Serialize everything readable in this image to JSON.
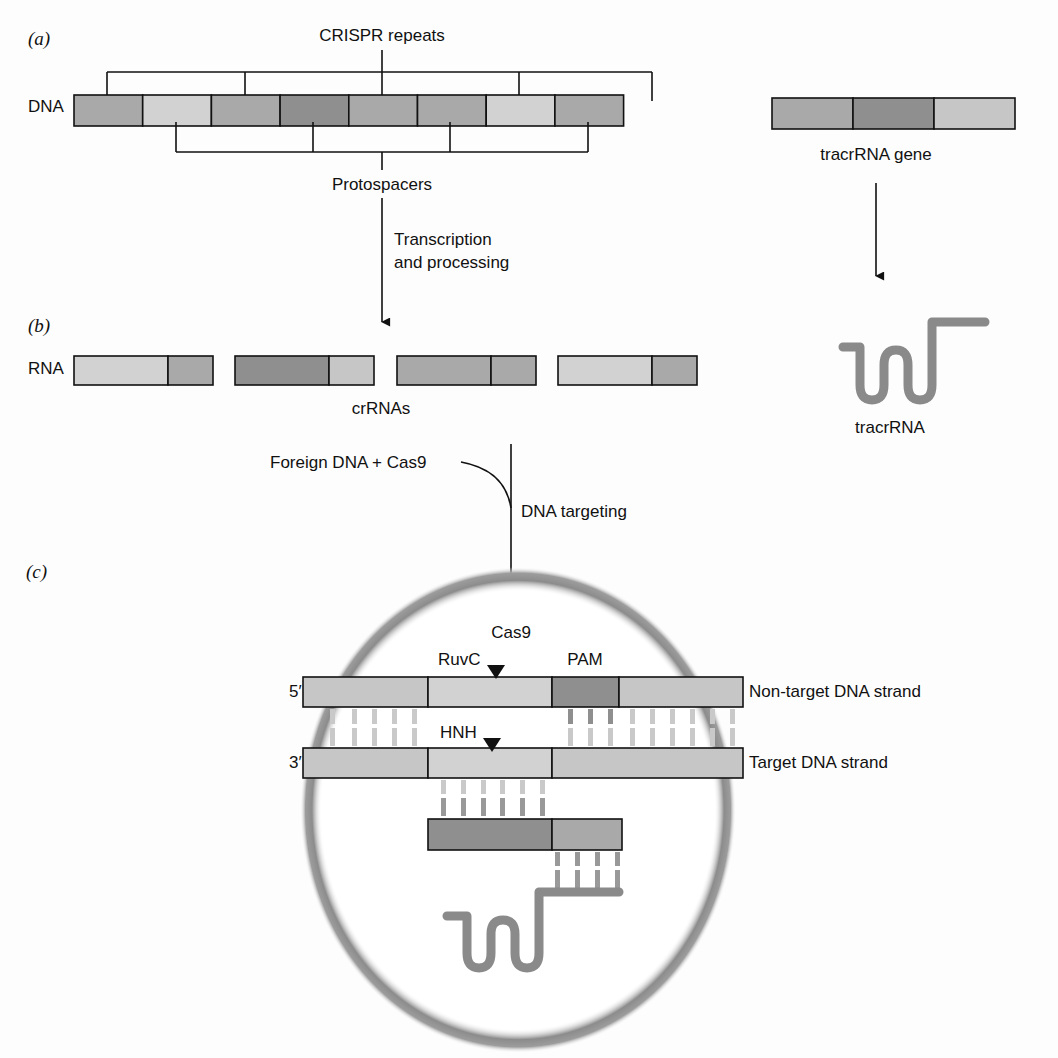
{
  "panels": {
    "a": "(a)",
    "b": "(b)",
    "c": "(c)"
  },
  "colors": {
    "light": "#c6c6c6",
    "mid": "#a9a9a9",
    "dark": "#8f8f8f",
    "pale": "#d2d2d2",
    "rna_strand": "#8a8a8a",
    "cas9_ring": "#9a9a9a",
    "pair_dash": "#c9c9c9"
  },
  "panel_a": {
    "dna_label": "DNA",
    "crispr_repeats_label": "CRISPR repeats",
    "protospacers_label": "Protospacers",
    "dna_segments": [
      {
        "shade": "mid"
      },
      {
        "shade": "pale"
      },
      {
        "shade": "mid"
      },
      {
        "shade": "dark"
      },
      {
        "shade": "mid"
      },
      {
        "shade": "mid"
      },
      {
        "shade": "pale"
      },
      {
        "shade": "mid"
      }
    ],
    "tracr_gene_label": "tracrRNA gene",
    "tracr_gene_segments": [
      {
        "shade": "mid"
      },
      {
        "shade": "dark"
      },
      {
        "shade": "light"
      }
    ]
  },
  "step1": {
    "line1": "Transcription",
    "line2": "and processing"
  },
  "panel_b": {
    "rna_label": "RNA",
    "crrnas_label": "crRNAs",
    "crrnas": [
      {
        "spacer": "pale",
        "repeat": "mid"
      },
      {
        "spacer": "dark",
        "repeat": "light"
      },
      {
        "spacer": "mid",
        "repeat": "mid"
      },
      {
        "spacer": "pale",
        "repeat": "mid"
      }
    ],
    "tracrrna_label": "tracrRNA"
  },
  "step2": {
    "input": "Foreign DNA + Cas9",
    "label": "DNA targeting"
  },
  "panel_c": {
    "cas9_label": "Cas9",
    "ruvc_label": "RuvC",
    "hnh_label": "HNH",
    "pam_label": "PAM",
    "five_prime": "5′",
    "three_prime": "3′",
    "non_target_label": "Non-target DNA strand",
    "target_label": "Target DNA strand"
  }
}
